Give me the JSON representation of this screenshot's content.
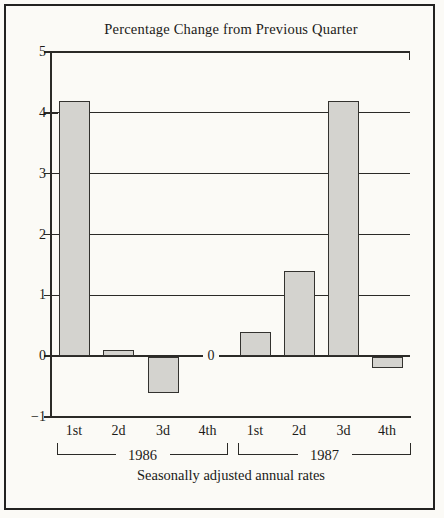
{
  "chart_data": {
    "type": "bar",
    "title": "Percentage Change from Previous Quarter",
    "footnote": "Seasonally adjusted annual rates",
    "xlabel": "",
    "ylabel": "",
    "ylim": [
      -1,
      5
    ],
    "grid": true,
    "legend": "none",
    "yticks": [
      {
        "v": 5,
        "label": "5"
      },
      {
        "v": 4,
        "label": "4"
      },
      {
        "v": 3,
        "label": "3"
      },
      {
        "v": 2,
        "label": "2"
      },
      {
        "v": 1,
        "label": "1"
      },
      {
        "v": 0,
        "label": "0"
      },
      {
        "v": -1,
        "label": "−1"
      }
    ],
    "zero_axis_inline_label": "0",
    "groups": [
      {
        "year": "1986",
        "categories": [
          "1st",
          "2d",
          "3d",
          "4th"
        ],
        "values": [
          4.2,
          0.1,
          -0.6,
          0
        ]
      },
      {
        "year": "1987",
        "categories": [
          "1st",
          "2d",
          "3d",
          "4th"
        ],
        "values": [
          0.4,
          1.4,
          4.2,
          -0.2
        ]
      }
    ],
    "colors": {
      "bar_fill": "#d4d3cf",
      "bar_border": "#33322f",
      "line": "#2b2a27",
      "text": "#1c1b18",
      "background": "#fbfaf6",
      "frame_border": "#232220"
    }
  }
}
